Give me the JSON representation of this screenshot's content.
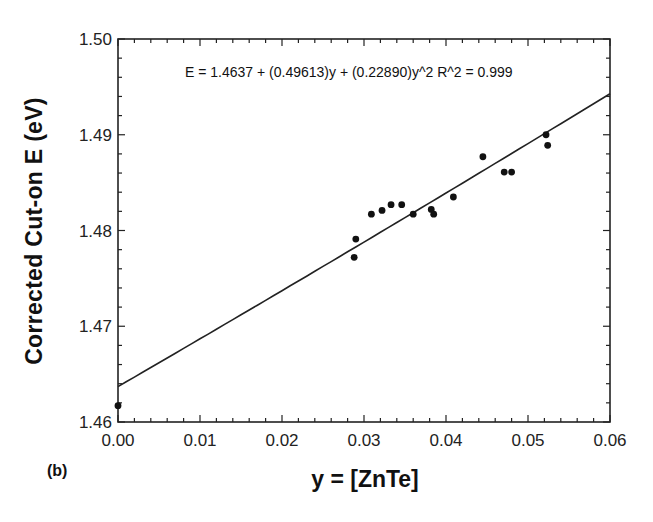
{
  "figure": {
    "panel_label": "(b)",
    "equation": "E = 1.4637 + (0.49613)y + (0.22890)y^2   R^2 = 0.999",
    "xlabel": "y  =  [ZnTe]",
    "ylabel": "Corrected  Cut-on  E  (eV)"
  },
  "chart_data": {
    "type": "scatter",
    "title": "",
    "xlabel": "y = [ZnTe]",
    "ylabel": "Corrected Cut-on E (eV)",
    "xlim": [
      0.0,
      0.06
    ],
    "ylim": [
      1.46,
      1.5
    ],
    "x_ticks": [
      "0.00",
      "0.01",
      "0.02",
      "0.03",
      "0.04",
      "0.05",
      "0.06"
    ],
    "y_ticks": [
      "1.46",
      "1.47",
      "1.48",
      "1.49",
      "1.50"
    ],
    "grid": false,
    "legend": null,
    "annotations": [
      "E = 1.4637 + (0.49613)y + (0.22890)y^2   R^2 = 0.999",
      "(b)"
    ],
    "series": [
      {
        "name": "measured",
        "type": "scatter",
        "x": [
          0.0,
          0.0288,
          0.029,
          0.0309,
          0.0322,
          0.0333,
          0.0346,
          0.036,
          0.0382,
          0.0385,
          0.0409,
          0.0445,
          0.0471,
          0.048,
          0.0522,
          0.0524
        ],
        "y": [
          1.4617,
          1.4772,
          1.4791,
          1.4817,
          1.4821,
          1.4827,
          1.4827,
          1.4817,
          1.4822,
          1.4817,
          1.4835,
          1.4877,
          1.4861,
          1.4861,
          1.49,
          1.4889
        ]
      },
      {
        "name": "quadratic fit",
        "type": "line",
        "coefficients": {
          "a0": 1.4637,
          "a1": 0.49613,
          "a2": 0.2289
        },
        "r_squared": 0.999,
        "x": [
          0.0,
          0.01,
          0.02,
          0.03,
          0.04,
          0.05,
          0.06
        ],
        "y": [
          1.4637,
          1.4687,
          1.4737,
          1.4788,
          1.4839,
          1.4891,
          1.4943
        ]
      }
    ]
  }
}
